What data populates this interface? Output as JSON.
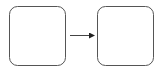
{
  "diagram": {
    "type": "flow",
    "nodes": [
      {
        "id": "box-1",
        "label": "",
        "x": 9.5,
        "y": 6.5,
        "w": 56,
        "h": 59,
        "radius": 8
      },
      {
        "id": "box-2",
        "label": "",
        "x": 97.5,
        "y": 6.5,
        "w": 56,
        "h": 59,
        "radius": 8
      }
    ],
    "edges": [
      {
        "from": "box-1",
        "to": "box-2",
        "x1": 70,
        "y1": 35.5,
        "x2": 94,
        "y2": 35.5
      }
    ],
    "colors": {
      "stroke": "#555555",
      "arrow": "#222222",
      "background": "#ffffff"
    }
  }
}
